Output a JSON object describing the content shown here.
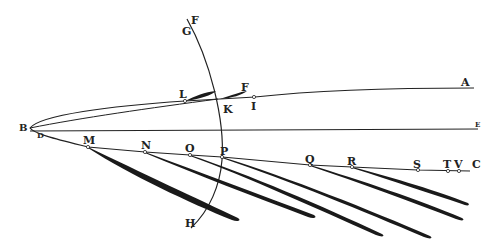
{
  "figure": {
    "background": "#ffffff",
    "ink": "#1e1e1e",
    "labels": {
      "A": "A",
      "B": "B",
      "C": "C",
      "D": "D",
      "E": "E",
      "F_top": "F",
      "F_tail": "F",
      "G": "G",
      "H": "H",
      "I": "I",
      "K": "K",
      "L": "L",
      "M": "M",
      "N": "N",
      "O": "O",
      "P": "P",
      "Q": "Q",
      "R": "R",
      "S": "S",
      "T": "T",
      "V": "V"
    }
  }
}
